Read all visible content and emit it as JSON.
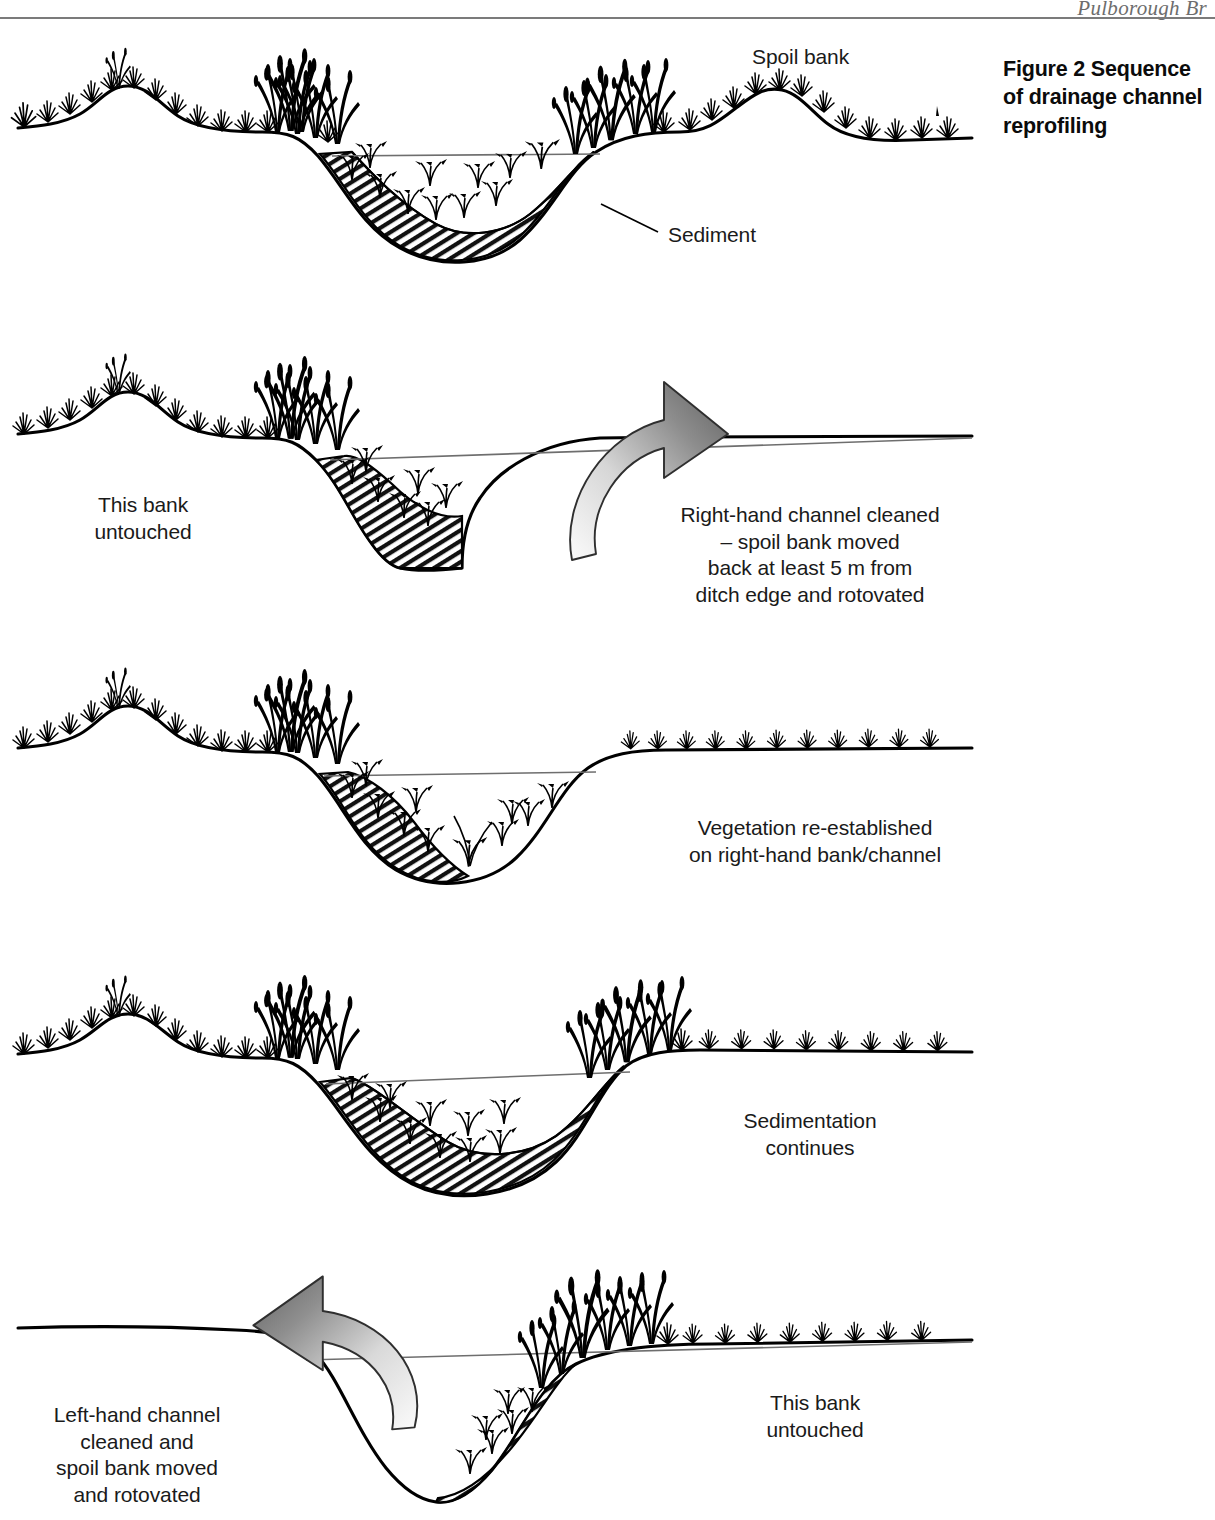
{
  "document": {
    "running_head": "Pulborough Br",
    "figure_caption": "Figure 2\nSequence of\ndrainage channel\nreprofiling"
  },
  "diagram": {
    "title": "Sequence of drainage channel reprofiling",
    "type": "cross-section-sequence",
    "panels": [
      {
        "id": "panel-1",
        "step": 1,
        "description": "Original ditch: both banks vegetated, channel silted with sediment, spoil bank present on right",
        "labels": [
          {
            "name": "spoil-bank",
            "text": "Spoil bank",
            "x": 752,
            "y": 46
          },
          {
            "name": "sediment",
            "text": "Sediment",
            "x": 670,
            "y": 224
          }
        ],
        "leaders": [
          {
            "name": "sediment-leader",
            "x1": 601,
            "y1": 204,
            "x2": 658,
            "y2": 232
          }
        ]
      },
      {
        "id": "panel-2",
        "step": 2,
        "description": "Right-hand channel freshly cleaned, bare profile, spoil removed",
        "labels": [
          {
            "name": "this-bank-untouched-left",
            "text": "This bank\nuntouched",
            "x": 85,
            "y": 494
          },
          {
            "name": "right-hand-cleaned",
            "text": "Right-hand channel cleaned\n– spoil bank moved\nback at least 5 m from\nditch edge and rotovated",
            "x": 672,
            "y": 504
          }
        ],
        "arrow": {
          "name": "move-right-arrow",
          "direction": "right"
        }
      },
      {
        "id": "panel-3",
        "step": 3,
        "description": "Vegetation beginning to return on the cleaned right-hand bank and channel",
        "labels": [
          {
            "name": "vegetation-re-established",
            "text": "Vegetation re-established\non right-hand bank/channel",
            "x": 676,
            "y": 817
          }
        ]
      },
      {
        "id": "panel-4",
        "step": 4,
        "description": "Both banks vegetated again and sediment accumulating across the channel",
        "labels": [
          {
            "name": "sedimentation-continues",
            "text": "Sedimentation\ncontinues",
            "x": 735,
            "y": 1111
          }
        ]
      },
      {
        "id": "panel-5",
        "step": 5,
        "description": "Left-hand channel now cleaned; right-hand bank left untouched",
        "labels": [
          {
            "name": "left-hand-cleaned",
            "text": "Left-hand channel\ncleaned and\nspoil bank moved\nand rotovated",
            "x": 36,
            "y": 1404
          },
          {
            "name": "this-bank-untouched-right",
            "text": "This bank\nuntouched",
            "x": 760,
            "y": 1392
          }
        ],
        "arrow": {
          "name": "move-left-arrow",
          "direction": "left"
        }
      }
    ],
    "colors": {
      "ink": "#000000",
      "water_line": "#6e6e6e",
      "arrow_dark": "#6b6b6b",
      "arrow_light": "#f2f2f2",
      "rule": "#7b7b7b",
      "background": "#ffffff"
    },
    "legend": {
      "hatching": "sediment fill",
      "thin_grey_line": "water level",
      "black_silhouettes": "emergent and bankside vegetation"
    }
  }
}
